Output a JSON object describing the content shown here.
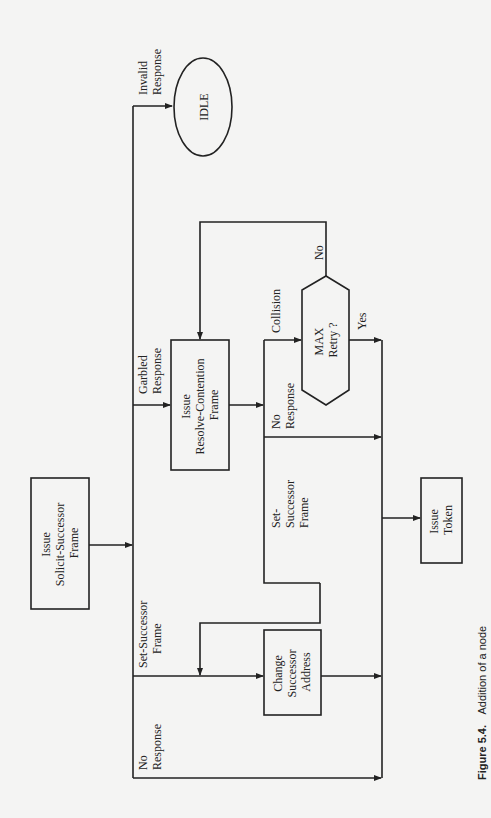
{
  "diagram": {
    "orientation": "rotated-90-ccw",
    "nodes": {
      "idle": {
        "label": "IDLE"
      },
      "solicit": {
        "lines": [
          "Issue",
          "Solicit-Successor",
          "Frame"
        ]
      },
      "resolve": {
        "lines": [
          "Issue",
          "Resolve-Contention",
          "Frame"
        ]
      },
      "max_retry": {
        "lines": [
          "MAX",
          "Retry ?"
        ]
      },
      "change": {
        "lines": [
          "Change",
          "Successor",
          "Address"
        ]
      },
      "token": {
        "lines": [
          "Issue",
          "Token"
        ]
      }
    },
    "edge_labels": {
      "invalid": [
        "Invalid",
        "Response"
      ],
      "garbled": [
        "Garbled",
        "Response"
      ],
      "set_successor_main": [
        "Set-Successor",
        "Frame"
      ],
      "no_response_main": [
        "No",
        "Response"
      ],
      "collision": "Collision",
      "no_retry": "No",
      "yes_retry": "Yes",
      "no_response_resolve": [
        "No",
        "Response"
      ],
      "set_successor_resolve": [
        "Set-",
        "Successor",
        "Frame"
      ]
    }
  },
  "caption": {
    "number": "Figure 5.4.",
    "text": "Addition of a node"
  }
}
